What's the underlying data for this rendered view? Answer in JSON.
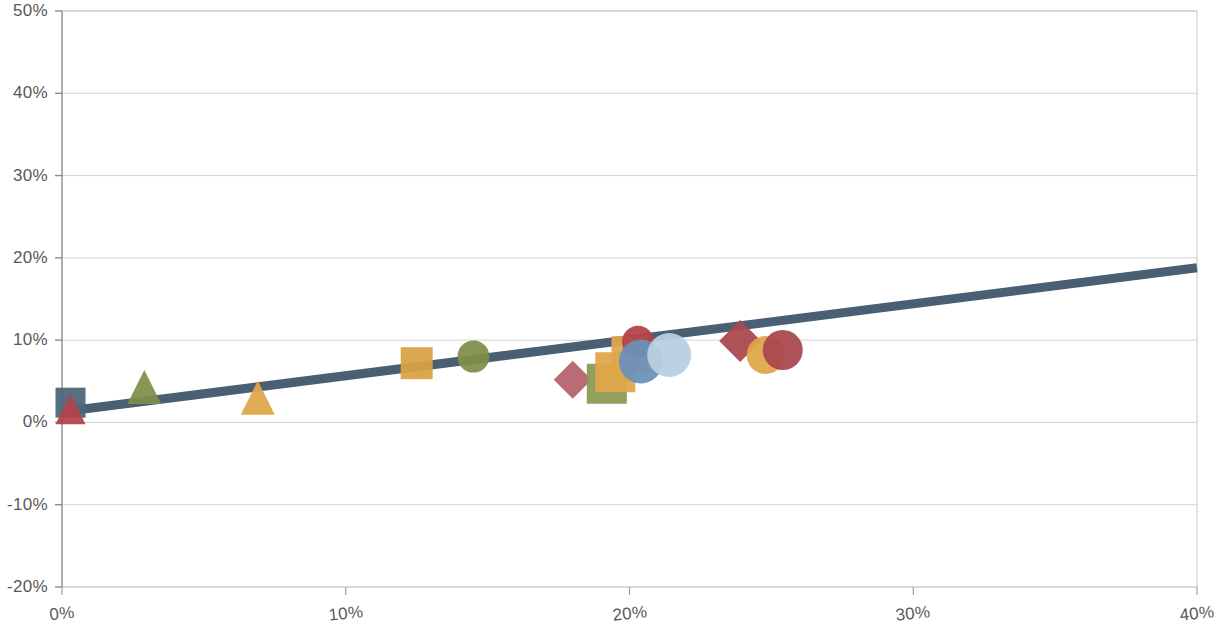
{
  "chart_data": {
    "type": "scatter",
    "title": "",
    "subtitle": "",
    "xlabel": "",
    "ylabel": "",
    "xlim": [
      0,
      40
    ],
    "ylim": [
      -20,
      50
    ],
    "grid": true,
    "legend": "none",
    "x_ticks": [
      "0%",
      "10%",
      "20%",
      "30%",
      "40%"
    ],
    "x_tick_values": [
      0,
      10,
      20,
      30,
      40
    ],
    "y_ticks": [
      "-20%",
      "-10%",
      "0%",
      "10%",
      "20%",
      "30%",
      "40%",
      "50%"
    ],
    "y_tick_values": [
      -20,
      -10,
      0,
      10,
      20,
      30,
      40,
      50
    ],
    "points": [
      {
        "id": "p1",
        "x": 0.3,
        "y": 2.4,
        "shape": "square",
        "color": "#4e6679",
        "size": 30,
        "label": ""
      },
      {
        "id": "p2",
        "x": 0.3,
        "y": 1.6,
        "shape": "triangle",
        "color": "#b4434a",
        "size": 30,
        "label": ""
      },
      {
        "id": "p3",
        "x": 2.9,
        "y": 4.3,
        "shape": "triangle",
        "color": "#7d8f4a",
        "size": 34,
        "label": ""
      },
      {
        "id": "p4",
        "x": 6.9,
        "y": 3.0,
        "shape": "triangle",
        "color": "#e0a64a",
        "size": 34,
        "label": ""
      },
      {
        "id": "p5",
        "x": 12.5,
        "y": 7.2,
        "shape": "square",
        "color": "#d9a344",
        "size": 32,
        "label": ""
      },
      {
        "id": "p6",
        "x": 14.5,
        "y": 8.0,
        "shape": "circle",
        "color": "#7d8f4a",
        "size": 32,
        "label": ""
      },
      {
        "id": "p7",
        "x": 18.0,
        "y": 5.2,
        "shape": "diamond",
        "color": "#b5636b",
        "size": 38,
        "label": ""
      },
      {
        "id": "p8",
        "x": 19.2,
        "y": 4.7,
        "shape": "square",
        "color": "#8a9a55",
        "size": 40,
        "label": ""
      },
      {
        "id": "p9",
        "x": 19.5,
        "y": 6.1,
        "shape": "square",
        "color": "#e0a64a",
        "size": 40,
        "label": ""
      },
      {
        "id": "p10",
        "x": 20.0,
        "y": 8.3,
        "shape": "square",
        "color": "#e0a64a",
        "size": 36,
        "label": ""
      },
      {
        "id": "p11",
        "x": 20.3,
        "y": 9.8,
        "shape": "circle",
        "color": "#b4434a",
        "size": 32,
        "label": ""
      },
      {
        "id": "p12",
        "x": 20.4,
        "y": 7.4,
        "shape": "circle",
        "color": "#6b90ba",
        "size": 44,
        "label": ""
      },
      {
        "id": "p13",
        "x": 21.4,
        "y": 8.2,
        "shape": "circle",
        "color": "#b8cfe0",
        "size": 44,
        "label": ""
      },
      {
        "id": "p14",
        "x": 23.9,
        "y": 9.9,
        "shape": "diamond",
        "color": "#a8484f",
        "size": 42,
        "label": ""
      },
      {
        "id": "p15",
        "x": 24.8,
        "y": 8.2,
        "shape": "circle",
        "color": "#e0a64a",
        "size": 38,
        "label": ""
      },
      {
        "id": "p16",
        "x": 25.4,
        "y": 8.8,
        "shape": "circle",
        "color": "#a8484f",
        "size": 40,
        "label": ""
      }
    ],
    "trendline": {
      "name": "linear-trend",
      "color": "#4a5f73",
      "width": 9,
      "x_start": 0,
      "y_start": 1.3,
      "x_end": 40,
      "y_end": 18.8
    },
    "plot_area": {
      "left_px": 62,
      "right_px": 1197,
      "top_px": 11,
      "bottom_px": 587
    },
    "colors": {
      "axis": "#a8a8a8",
      "grid": "#c9c9c9",
      "tick_text": "#59595b",
      "trend": "#4a5f73",
      "background": "#ffffff"
    }
  }
}
